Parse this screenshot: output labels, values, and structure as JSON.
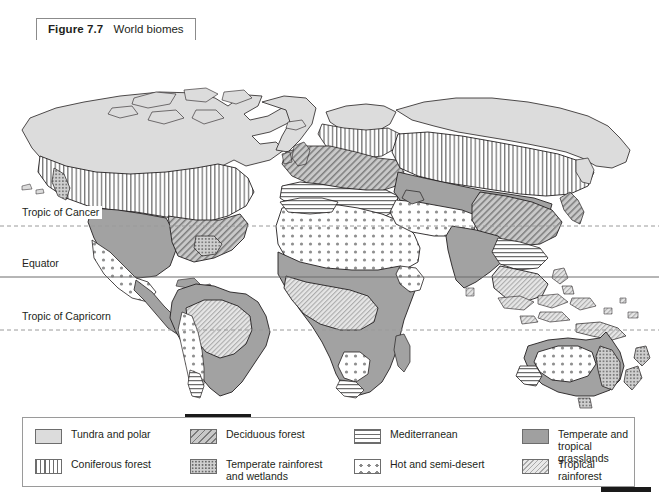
{
  "caption": {
    "figure_number": "Figure 7.7",
    "title": "World biomes"
  },
  "map": {
    "latitude_lines": [
      {
        "label": "Tropic of Cancer",
        "style": "dashed"
      },
      {
        "label": "Equator",
        "style": "solid"
      },
      {
        "label": "Tropic of Capricorn",
        "style": "dashed"
      }
    ],
    "ocean_color": "#ffffff",
    "coastline_color": "#231f20"
  },
  "legend": {
    "items": [
      {
        "label": "Tundra and polar",
        "pattern": "solid-light-gray",
        "color": "#dcdcdc",
        "swatch_name": "tundra-and-polar-swatch"
      },
      {
        "label": "Deciduous forest",
        "pattern": "diagonal-hatch",
        "color": "#7a7a7a",
        "swatch_name": "deciduous-forest-swatch"
      },
      {
        "label": "Mediterranean",
        "pattern": "horizontal-lines",
        "color": "#6e6e6e",
        "swatch_name": "mediterranean-swatch"
      },
      {
        "label": "Temperate and\ntropical grasslands",
        "pattern": "solid-mid-gray",
        "color": "#a0a0a0",
        "swatch_name": "temperate-and-tropical-grasslands-swatch"
      },
      {
        "label": "Coniferous forest",
        "pattern": "vertical-lines",
        "color": "#6e6e6e",
        "swatch_name": "coniferous-forest-swatch"
      },
      {
        "label": "Temperate rainforest\nand wetlands",
        "pattern": "dense-dots",
        "color": "#6a6a6a",
        "swatch_name": "temperate-rainforest-and-wetlands-swatch"
      },
      {
        "label": "Hot and semi-desert",
        "pattern": "sparse-large-dots",
        "color": "#8a8a8a",
        "swatch_name": "hot-and-semi-desert-swatch"
      },
      {
        "label": "Tropical rainforest",
        "pattern": "fine-light-hatch",
        "color": "#a9a9a9",
        "swatch_name": "tropical-rainforest-swatch"
      }
    ]
  }
}
